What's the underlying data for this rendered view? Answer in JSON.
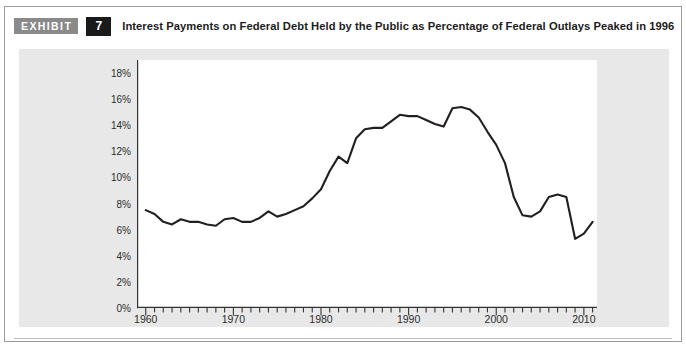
{
  "header": {
    "exhibit_tag": "EXHIBIT",
    "exhibit_number": "7",
    "title": "Interest Payments on Federal Debt Held by the Public as Percentage of Federal Outlays Peaked in 1996"
  },
  "colors": {
    "tag_background": "#8a8a8a",
    "number_background": "#1a1a1a",
    "panel_background": "#e8e8e8",
    "plot_background": "#ffffff",
    "line": "#231f20",
    "axis": "#333333",
    "frame_border": "#9b9b9b"
  },
  "chart_data": {
    "type": "line",
    "title": "Interest Payments on Federal Debt Held by the Public as Percentage of Federal Outlays Peaked in 1996",
    "xlabel": "",
    "ylabel": "",
    "xlim": [
      1959,
      2011.5
    ],
    "ylim": [
      0,
      19
    ],
    "grid": false,
    "legend": "none",
    "ytick_values": [
      0,
      2,
      4,
      6,
      8,
      10,
      12,
      14,
      16,
      18
    ],
    "ytick_labels": [
      "0%",
      "2%",
      "4%",
      "6%",
      "8%",
      "10%",
      "12%",
      "14%",
      "16%",
      "18%"
    ],
    "xtick_major_values": [
      1960,
      1970,
      1980,
      1990,
      2000,
      2010
    ],
    "xtick_major_labels": [
      "1960",
      "1970",
      "1980",
      "1990",
      "2000",
      "2010"
    ],
    "xtick_minor_step": 1,
    "series": [
      {
        "name": "Interest Payments as Percentage of Federal Outlays",
        "x": [
          1960,
          1961,
          1962,
          1963,
          1964,
          1965,
          1966,
          1967,
          1968,
          1969,
          1970,
          1971,
          1972,
          1973,
          1974,
          1975,
          1976,
          1977,
          1978,
          1979,
          1980,
          1981,
          1982,
          1983,
          1984,
          1985,
          1986,
          1987,
          1988,
          1989,
          1990,
          1991,
          1992,
          1993,
          1994,
          1995,
          1996,
          1997,
          1998,
          1999,
          2000,
          2001,
          2002,
          2003,
          2004,
          2005,
          2006,
          2007,
          2008,
          2009,
          2010,
          2011
        ],
        "values": [
          7.5,
          7.2,
          6.6,
          6.4,
          6.8,
          6.6,
          6.6,
          6.4,
          6.3,
          6.8,
          6.9,
          6.6,
          6.6,
          6.9,
          7.4,
          7.0,
          7.2,
          7.5,
          7.8,
          8.4,
          9.1,
          10.5,
          11.6,
          11.1,
          13.0,
          13.7,
          13.8,
          13.8,
          14.3,
          14.8,
          14.7,
          14.7,
          14.4,
          14.1,
          13.9,
          15.3,
          15.4,
          15.2,
          14.6,
          13.5,
          12.5,
          11.1,
          8.5,
          7.1,
          7.0,
          7.4,
          8.5,
          8.7,
          8.5,
          5.3,
          5.7,
          6.6
        ]
      }
    ],
    "annotations": [
      {
        "text": "Peak in 1996",
        "x": 1996,
        "y": 15.4
      }
    ]
  }
}
